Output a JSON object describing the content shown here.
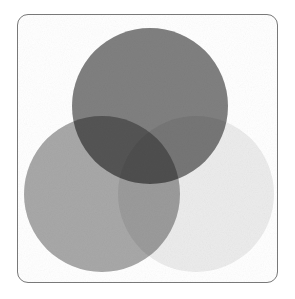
{
  "figure": {
    "kind": "venn-diagram",
    "set_count": 3,
    "title": "",
    "caption": "",
    "background_color": "#ffffff",
    "canvas_width": 295,
    "canvas_height": 299
  },
  "frame": {
    "name": "rounded-border",
    "x": 17,
    "y": 14,
    "width": 261,
    "height": 269,
    "corner_radius": 11,
    "stroke_color": "#7a7a7a",
    "stroke_width": 1,
    "fill_color": "#ffffff"
  },
  "chart_data": {
    "type": "venn",
    "title": "",
    "xlabel": "",
    "ylabel": "",
    "legend_position": "none",
    "grid": false,
    "sets": [
      {
        "id": "top",
        "label": "",
        "cx": 150,
        "cy": 106,
        "r": 78,
        "fill": "#808080",
        "tone_value": 128
      },
      {
        "id": "left",
        "label": "",
        "cx": 102,
        "cy": 194,
        "r": 78,
        "fill": "#a8a8a8",
        "tone_value": 168
      },
      {
        "id": "right",
        "label": "",
        "cx": 196,
        "cy": 194,
        "r": 78,
        "fill": "#ececec",
        "tone_value": 236
      }
    ],
    "regions": [
      {
        "id": "top-only",
        "members": [
          "top"
        ],
        "fill": "#808080"
      },
      {
        "id": "left-only",
        "members": [
          "left"
        ],
        "fill": "#a8a8a8"
      },
      {
        "id": "right-only",
        "members": [
          "right"
        ],
        "fill": "#ececec"
      },
      {
        "id": "top-left",
        "members": [
          "top",
          "left"
        ],
        "fill": "#5e5e5e"
      },
      {
        "id": "top-right",
        "members": [
          "top",
          "right"
        ],
        "fill": "#9a9a9a"
      },
      {
        "id": "left-right",
        "members": [
          "left",
          "right"
        ],
        "fill": "#b4b4b4"
      },
      {
        "id": "top-left-right",
        "members": [
          "top",
          "left",
          "right"
        ],
        "fill": "#2a2a2a"
      }
    ],
    "blend_mode": "multiply"
  },
  "accessibility": {
    "alt_text": "Three overlapping grayscale circles forming a Venn diagram inside a thin rounded rectangle border"
  }
}
